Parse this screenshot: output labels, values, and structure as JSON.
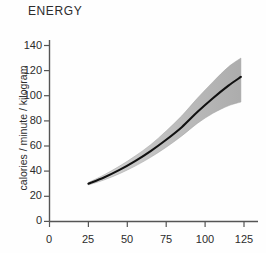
{
  "chart_data": {
    "type": "line",
    "title": "ENERGY",
    "subtitle": "",
    "xlabel": "",
    "ylabel": "calories / minute / kilogram",
    "xlim": [
      0,
      135
    ],
    "ylim": [
      0,
      150
    ],
    "xticks": [
      0,
      25,
      50,
      75,
      100,
      125
    ],
    "yticks": [
      0,
      20,
      40,
      60,
      80,
      100,
      120,
      140
    ],
    "xtick_labels": [
      "0",
      "25",
      "50",
      "75",
      "100",
      "125"
    ],
    "ytick_labels": [
      "0",
      "20",
      "40",
      "60",
      "80",
      "100",
      "120",
      "140"
    ],
    "grid": false,
    "legend": null,
    "legend_position": "none",
    "spines": [
      "left",
      "bottom"
    ],
    "series": [
      {
        "name": "mean energy expenditure",
        "style": "solid-black-line",
        "color": "#111111",
        "x": [
          25,
          35,
          45,
          55,
          65,
          75,
          85,
          95,
          105,
          115,
          123
        ],
        "values": [
          30,
          35,
          41,
          48,
          56,
          65,
          75,
          87,
          98,
          108,
          115
        ]
      },
      {
        "name": "uncertainty band upper",
        "style": "shaded-band-edge",
        "color": "#9a9a9a",
        "x": [
          25,
          35,
          45,
          55,
          65,
          75,
          85,
          95,
          105,
          115,
          123
        ],
        "values": [
          31,
          37,
          44,
          52,
          61,
          72,
          84,
          98,
          111,
          123,
          130
        ]
      },
      {
        "name": "uncertainty band lower",
        "style": "shaded-band-edge",
        "color": "#9a9a9a",
        "x": [
          25,
          35,
          45,
          55,
          65,
          75,
          85,
          95,
          105,
          115,
          123
        ],
        "values": [
          29,
          33,
          38,
          44,
          51,
          59,
          68,
          78,
          86,
          92,
          95
        ]
      }
    ],
    "band_color": "#a8a8a8",
    "line_color": "#111111",
    "axis_color": "#555555",
    "background_color": "#fefefe"
  },
  "axis": {
    "title": "ENERGY",
    "ylabel": "calories / minute / kilogram",
    "ytick_labels": [
      "140",
      "120",
      "100",
      "80",
      "60",
      "40",
      "20",
      "0"
    ],
    "xtick_labels": [
      "0",
      "25",
      "50",
      "75",
      "100",
      "125"
    ]
  }
}
